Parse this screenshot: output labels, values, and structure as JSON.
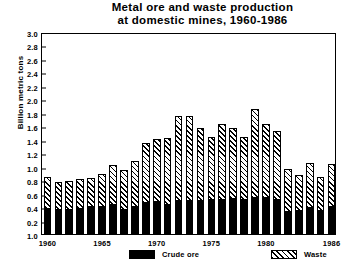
{
  "chart_data": {
    "type": "bar",
    "stacked": true,
    "title": "Metal ore and waste production at domestic mines, 1960-1986",
    "title_lines": [
      "Metal ore and waste production",
      "at domestic mines, 1960-1986"
    ],
    "xlabel": "",
    "ylabel": "Billion metric tons",
    "ylim": [
      0.0,
      3.0
    ],
    "ytick_labels": [
      "3.0",
      "2.8",
      "2.6",
      "2.4",
      "2.2",
      "2.0",
      "1.8",
      "1.6",
      "1.4",
      "1.2",
      "1.0",
      "0.8",
      "0.6",
      "0.4",
      "0.2",
      "1.0"
    ],
    "ytick_values": [
      3.0,
      2.8,
      2.6,
      2.4,
      2.2,
      2.0,
      1.8,
      1.6,
      1.4,
      1.2,
      1.0,
      0.8,
      0.6,
      0.4,
      0.2,
      0.0
    ],
    "grid": false,
    "legend_position": "below-axes",
    "categories": [
      1960,
      1961,
      1962,
      1963,
      1964,
      1965,
      1966,
      1967,
      1968,
      1969,
      1970,
      1971,
      1972,
      1973,
      1974,
      1975,
      1976,
      1977,
      1978,
      1979,
      1980,
      1981,
      1982,
      1983,
      1984,
      1985,
      1986
    ],
    "xtick_labels": [
      "1960",
      "1965",
      "1970",
      "1975",
      "1980",
      "1986"
    ],
    "xtick_categories": [
      1960,
      1965,
      1970,
      1975,
      1980,
      1986
    ],
    "series": [
      {
        "name": "Crude ore",
        "color": "#000000",
        "fill": "solid",
        "values": [
          0.39,
          0.37,
          0.37,
          0.38,
          0.41,
          0.42,
          0.44,
          0.37,
          0.42,
          0.47,
          0.49,
          0.44,
          0.5,
          0.51,
          0.51,
          0.52,
          0.52,
          0.54,
          0.52,
          0.55,
          0.55,
          0.52,
          0.34,
          0.36,
          0.4,
          0.36,
          0.41
        ]
      },
      {
        "name": "Waste",
        "color": "#ffffff",
        "fill": "diagonal-hatch",
        "values": [
          0.46,
          0.4,
          0.41,
          0.43,
          0.42,
          0.47,
          0.59,
          0.58,
          0.67,
          0.88,
          0.92,
          0.99,
          1.25,
          1.24,
          1.06,
          0.92,
          1.11,
          1.03,
          0.92,
          1.3,
          1.08,
          1.01,
          0.63,
          0.52,
          0.66,
          0.48,
          0.63
        ]
      }
    ],
    "totals": [
      0.85,
      0.77,
      0.78,
      0.81,
      0.83,
      0.89,
      1.03,
      0.95,
      1.09,
      1.35,
      1.41,
      1.43,
      1.75,
      1.75,
      1.57,
      1.44,
      1.63,
      1.57,
      1.44,
      1.85,
      1.63,
      1.53,
      0.97,
      0.88,
      1.06,
      0.84,
      1.04
    ]
  },
  "legend": {
    "entries": [
      {
        "label": "Crude ore",
        "pattern": "solid-black"
      },
      {
        "label": "Waste",
        "pattern": "diagonal-hatch"
      }
    ]
  }
}
